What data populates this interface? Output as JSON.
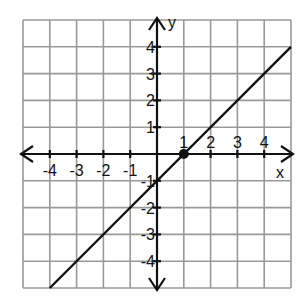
{
  "chart_data": {
    "type": "line",
    "title": "",
    "xlabel": "x",
    "ylabel": "y",
    "xlim": [
      -5,
      5
    ],
    "ylim": [
      -5,
      5
    ],
    "grid": true,
    "x_tick_labels": [
      "-4",
      "-3",
      "-2",
      "-1",
      "1",
      "2",
      "3",
      "4"
    ],
    "y_tick_labels": [
      "4",
      "3",
      "2",
      "1",
      "-1",
      "-2",
      "-3",
      "-4"
    ],
    "series": [
      {
        "name": "line",
        "x": [
          -4,
          5
        ],
        "y": [
          -5,
          4
        ],
        "equation": "y = x - 1"
      }
    ],
    "points": [
      {
        "x": 1,
        "y": 0,
        "label": "x-intercept"
      }
    ]
  },
  "axes": {
    "x_label": "x",
    "y_label": "y"
  }
}
